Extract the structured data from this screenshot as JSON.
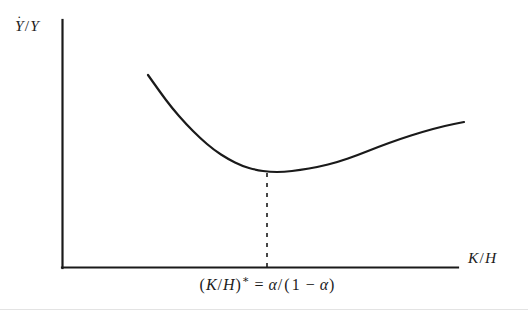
{
  "figure": {
    "background_color": "#ffffff",
    "ink_color": "#1a1a1a",
    "y_axis_label": "Ẏ/Y",
    "y_axis_label_parts": {
      "base": "Y",
      "accent": "˙",
      "separator": "/",
      "denominator": "Y"
    },
    "x_axis_label": "K/H",
    "x_axis_annotation": "(K/H)* = α/(1 − α)",
    "x_axis_annotation_parts": {
      "open": "(",
      "numerator": "K",
      "slash": "/",
      "denominator": "H",
      "close": ")",
      "star": "*",
      "equals": "=",
      "rhs_numerator": "α",
      "rhs_slash": "/",
      "rhs_open": "(",
      "one": "1",
      "minus": "−",
      "alpha": "α",
      "rhs_close": ")"
    }
  },
  "chart_data": {
    "type": "line",
    "title": "",
    "xlabel": "K/H",
    "ylabel": "Ẏ/Y",
    "grid": false,
    "legend": null,
    "axis_style": "open-L (left spine and bottom spine only, no ticks, no tick labels)",
    "xlim_px": [
      62,
      458
    ],
    "ylim_px": [
      20,
      268
    ],
    "series": [
      {
        "name": "growth-rate-curve",
        "shape": "U-shaped convex curve with interior minimum",
        "stroke": "#1a1a1a",
        "stroke_width": 2.2,
        "points_px": [
          [
            148,
            75
          ],
          [
            160,
            92
          ],
          [
            172,
            108
          ],
          [
            186,
            124
          ],
          [
            200,
            138
          ],
          [
            214,
            150
          ],
          [
            228,
            159
          ],
          [
            242,
            166
          ],
          [
            256,
            170
          ],
          [
            270,
            172
          ],
          [
            284,
            172
          ],
          [
            300,
            170
          ],
          [
            318,
            167
          ],
          [
            338,
            162
          ],
          [
            358,
            155
          ],
          [
            378,
            147
          ],
          [
            400,
            139
          ],
          [
            422,
            132
          ],
          [
            444,
            126
          ],
          [
            464,
            122
          ]
        ]
      }
    ],
    "annotations": [
      {
        "name": "optimum-dashed-line",
        "type": "vertical-dashed-line",
        "x_px": 267,
        "y_top_px": 173,
        "y_bottom_px": 268,
        "dash_on_px": 4,
        "dash_off_px": 6,
        "stroke": "#1a1a1a",
        "stroke_width": 1.6
      },
      {
        "name": "optimum-label",
        "type": "text",
        "text": "(K/H)* = α/(1 − α)",
        "anchor_x_px": 267,
        "y_px": 290
      }
    ]
  }
}
